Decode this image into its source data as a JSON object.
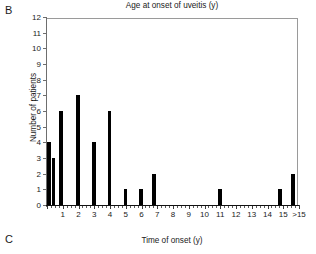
{
  "panels": {
    "current_label": "B",
    "next_label": "C"
  },
  "chart_data": {
    "type": "bar",
    "title": "Age at onset of uveitis (y)",
    "xlabel": "Time of onset (y)",
    "ylabel": "Number of patients",
    "ylim": [
      0,
      12
    ],
    "xlim": [
      0,
      16
    ],
    "grid": false,
    "legend": null,
    "ytick_labels": [
      "0",
      "1",
      "2",
      "3",
      "4",
      "5",
      "6",
      "7",
      "8",
      "9",
      "10",
      "11",
      "12"
    ],
    "ytick_values": [
      0,
      1,
      2,
      3,
      4,
      5,
      6,
      7,
      8,
      9,
      10,
      11,
      12
    ],
    "xtick_labels": [
      "1",
      "2",
      "3",
      "4",
      "5",
      "6",
      "7",
      "8",
      "9",
      "10",
      "11",
      "12",
      "13",
      "14",
      "15",
      ">15"
    ],
    "xtick_values": [
      1,
      2,
      3,
      4,
      5,
      6,
      7,
      8,
      9,
      10,
      11,
      12,
      13,
      14,
      15,
      16
    ],
    "xtick_minor_step": 0.25,
    "bar_color": "#000000",
    "bar_width_years": 0.22,
    "x": [
      0.12,
      0.42,
      0.88,
      1.98,
      2.98,
      3.98,
      4.98,
      5.98,
      6.8,
      10.98,
      14.8,
      15.62
    ],
    "values": [
      4,
      3,
      6,
      7,
      4,
      6,
      1,
      1,
      2,
      1,
      1,
      2
    ],
    "points": [
      {
        "x": 0.12,
        "y": 4
      },
      {
        "x": 0.42,
        "y": 3
      },
      {
        "x": 0.88,
        "y": 6
      },
      {
        "x": 1.98,
        "y": 7
      },
      {
        "x": 2.98,
        "y": 4
      },
      {
        "x": 3.98,
        "y": 6
      },
      {
        "x": 4.98,
        "y": 1
      },
      {
        "x": 5.98,
        "y": 1
      },
      {
        "x": 6.8,
        "y": 2
      },
      {
        "x": 10.98,
        "y": 1
      },
      {
        "x": 14.8,
        "y": 1
      },
      {
        "x": 15.62,
        "y": 2
      }
    ],
    "total_patients": 38
  }
}
